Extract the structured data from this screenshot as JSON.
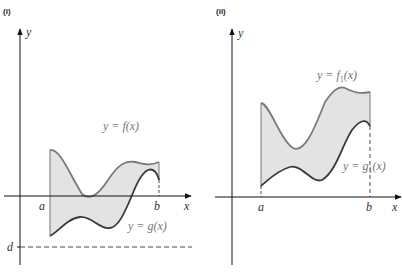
{
  "figure": {
    "panels": [
      {
        "id": "i",
        "label": "(i)",
        "axes": {
          "x_label": "x",
          "y_label": "y"
        },
        "ticks": {
          "a": "a",
          "b": "b",
          "d": "d"
        },
        "upper_curve_label": "y = f(x)",
        "lower_curve_label": "y = g(x)",
        "region_fill": "#e3e3e3",
        "upper_curve_color": "#7a7a7a",
        "lower_curve_color": "#3a3a3a"
      },
      {
        "id": "ii",
        "label": "(ii)",
        "axes": {
          "x_label": "x",
          "y_label": "y"
        },
        "ticks": {
          "a": "a",
          "b": "b"
        },
        "upper_curve_label_main": "y = f",
        "upper_curve_label_sub": "1",
        "upper_curve_label_tail": "(x)",
        "lower_curve_label_main": "y = g",
        "lower_curve_label_sub": "1",
        "lower_curve_label_tail": "(x)",
        "region_fill": "#e3e3e3",
        "upper_curve_color": "#7a7a7a",
        "lower_curve_color": "#3a3a3a"
      }
    ]
  }
}
